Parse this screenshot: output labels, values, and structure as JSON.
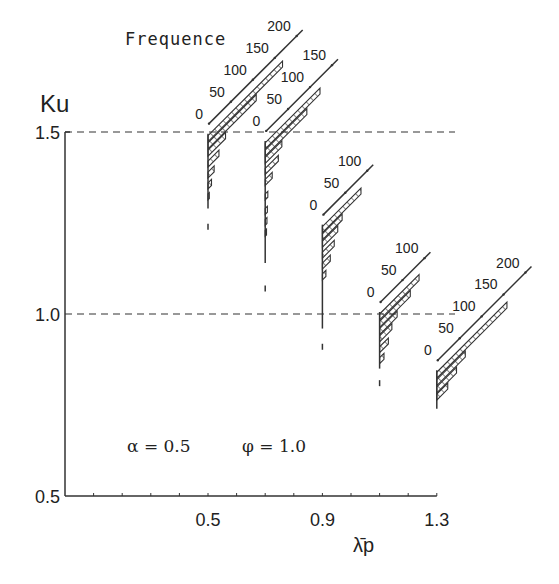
{
  "chart_data": {
    "type": "histogram-3d-offset",
    "title": "",
    "xlabel": "λ̄p",
    "ylabel": "Ku",
    "frequency_label": "Frequence",
    "annotation": "α = 0.5    φ = 1.0",
    "annotation_parts": {
      "alpha": "α = 0.5",
      "phi": "φ = 1.0"
    },
    "xlim": [
      0.0,
      1.3
    ],
    "ylim": [
      0.5,
      1.5
    ],
    "x_tick_labels": [
      "0.5",
      "0.9",
      "1.3"
    ],
    "x_ticks": [
      0.5,
      0.9,
      1.3
    ],
    "x_minor_step": 0.1,
    "y_tick_labels": [
      "0.5",
      "1.0",
      "1.5"
    ],
    "y_ticks": [
      0.5,
      1.0,
      1.5
    ],
    "reference_lines": [
      1.0,
      1.5
    ],
    "histograms": [
      {
        "x": 0.5,
        "freq_axis_ticks": [
          "0",
          "50",
          "100",
          "150",
          "200"
        ],
        "freq_axis_max": 200,
        "bins": [
          {
            "ku": 1.49,
            "freq": 170
          },
          {
            "ku": 1.47,
            "freq": 110
          },
          {
            "ku": 1.45,
            "freq": 40
          },
          {
            "ku": 1.42,
            "freq": 25
          },
          {
            "ku": 1.39,
            "freq": 14
          },
          {
            "ku": 1.36,
            "freq": 8
          },
          {
            "ku": 1.33,
            "freq": 3
          }
        ],
        "spine_bottom_ku": 1.29,
        "outlier_ku": 1.24
      },
      {
        "x": 0.7,
        "freq_axis_ticks": [
          "0",
          "50",
          "100",
          "150"
        ],
        "freq_axis_max": 150,
        "bins": [
          {
            "ku": 1.47,
            "freq": 125
          },
          {
            "ku": 1.45,
            "freq": 95
          },
          {
            "ku": 1.43,
            "freq": 38
          },
          {
            "ku": 1.4,
            "freq": 30
          },
          {
            "ku": 1.37,
            "freq": 16
          },
          {
            "ku": 1.33,
            "freq": 6
          },
          {
            "ku": 1.29,
            "freq": 5
          },
          {
            "ku": 1.26,
            "freq": 4
          },
          {
            "ku": 1.23,
            "freq": 3
          }
        ],
        "spine_bottom_ku": 1.14,
        "outlier_ku": 1.07
      },
      {
        "x": 0.9,
        "freq_axis_ticks": [
          "0",
          "50",
          "100"
        ],
        "freq_axis_max": 100,
        "bins": [
          {
            "ku": 1.24,
            "freq": 88
          },
          {
            "ku": 1.22,
            "freq": 45
          },
          {
            "ku": 1.2,
            "freq": 35
          },
          {
            "ku": 1.17,
            "freq": 27
          },
          {
            "ku": 1.14,
            "freq": 18
          },
          {
            "ku": 1.11,
            "freq": 8
          }
        ],
        "spine_bottom_ku": 0.96,
        "outlier_ku": 0.91
      },
      {
        "x": 1.1,
        "freq_axis_ticks": [
          "0",
          "50",
          "100"
        ],
        "freq_axis_max": 100,
        "bins": [
          {
            "ku": 1.0,
            "freq": 90
          },
          {
            "ku": 0.98,
            "freq": 70
          },
          {
            "ku": 0.96,
            "freq": 40
          },
          {
            "ku": 0.94,
            "freq": 28
          },
          {
            "ku": 0.91,
            "freq": 20
          },
          {
            "ku": 0.88,
            "freq": 10
          }
        ],
        "spine_bottom_ku": 0.85,
        "outlier_ku": 0.81
      },
      {
        "x": 1.3,
        "freq_axis_ticks": [
          "0",
          "50",
          "100",
          "150",
          "200"
        ],
        "freq_axis_max": 200,
        "bins": [
          {
            "ku": 0.84,
            "freq": 160
          },
          {
            "ku": 0.82,
            "freq": 65
          },
          {
            "ku": 0.8,
            "freq": 45
          },
          {
            "ku": 0.78,
            "freq": 25
          }
        ],
        "spine_bottom_ku": 0.74,
        "outlier_ku": null
      }
    ]
  }
}
